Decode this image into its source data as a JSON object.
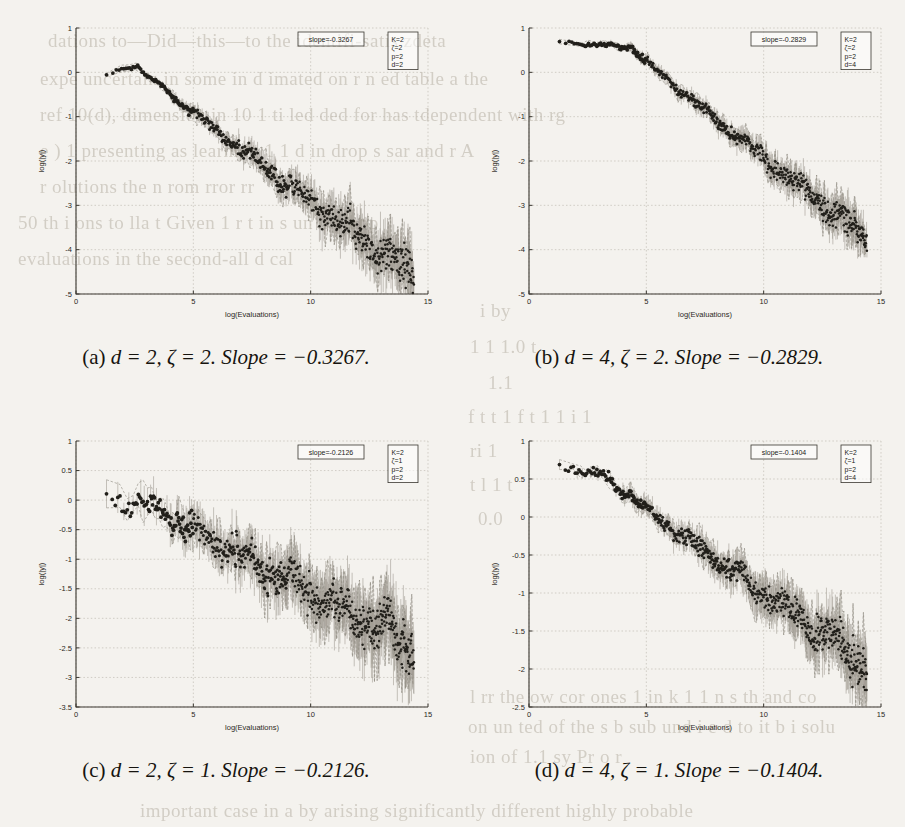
{
  "page": {
    "bleed_through_lines": [
      {
        "text": "dations to—Did—this—to the identifi-satis zdeta",
        "x": 48,
        "y": 30
      },
      {
        "text": "expe uncertain in some in d   imated on r n   ed table a the",
        "x": 40,
        "y": 68
      },
      {
        "text": "ref 10(d), dimension in 10 1 ti   led ded for has tdependent with rg",
        "x": 40,
        "y": 104
      },
      {
        "text": "e  )  1 presenting as learning     1     1  d   in drop   s   sar   and r    A",
        "x": 40,
        "y": 140
      },
      {
        "text": "r olutions the   n   rom   rror rr",
        "x": 40,
        "y": 176
      },
      {
        "text": "50 th   i   ons   to lla  t    Given   1    r    t     in   s    un   n   1    upp",
        "x": 18,
        "y": 212
      },
      {
        "text": "evaluations in the  second-all d  cal",
        "x": 18,
        "y": 248
      },
      {
        "text": "i                              by",
        "x": 480,
        "y": 300
      },
      {
        "text": "1   1                   1.0   t",
        "x": 470,
        "y": 336
      },
      {
        "text": "1.1",
        "x": 488,
        "y": 372
      },
      {
        "text": "f    t                   t   1    f    t   1   1   i    1",
        "x": 468,
        "y": 406
      },
      {
        "text": "ri                              1",
        "x": 470,
        "y": 440
      },
      {
        "text": "t    l    1                 t",
        "x": 470,
        "y": 474
      },
      {
        "text": "0.0",
        "x": 478,
        "y": 508
      },
      {
        "text": "l    rr     the   ow   cor   ones     1   in    k    1   1   n    s   th    and   co",
        "x": 470,
        "y": 686
      },
      {
        "text": "on   un   ted of the   s   b   sub   und   i   e     d    to   it   b   i   solu",
        "x": 468,
        "y": 716
      },
      {
        "text": "ion   of    1.1   sy    Pr    o    r",
        "x": 470,
        "y": 746
      },
      {
        "text": "important case in a by arising significantly different highly probable",
        "x": 140,
        "y": 800
      }
    ]
  },
  "figures": [
    {
      "id": "a",
      "caption_label": "(a)",
      "caption_body": "d = 2, ζ = 2.",
      "caption_slope": "Slope = −0.3267.",
      "slope_box": "slope=-0.3267",
      "legend": [
        "K=2",
        "ζ=2",
        "p=2",
        "d=2"
      ],
      "chart_data": {
        "type": "scatter",
        "title": "",
        "xlabel": "log(Evaluations)",
        "ylabel": "log(|y|)",
        "xlim": [
          0,
          15
        ],
        "ylim": [
          -5,
          1
        ],
        "xticks": [
          0,
          5,
          10,
          15
        ],
        "yticks": [
          1,
          0,
          -1,
          -2,
          -3,
          -4,
          -5
        ],
        "xtick_labels": [
          "0",
          "5",
          "10",
          "15"
        ],
        "ytick_labels": [
          "1",
          "0",
          "-1",
          "-2",
          "-3",
          "-4",
          "-5"
        ],
        "grid": true,
        "legend_position": "top-right",
        "fit_slope": -0.3267,
        "fit_intercept": 0.55,
        "series": [
          {
            "name": "log|y| vs log(Evaluations)",
            "x_start": 1.3,
            "x_end": 14.4,
            "y_start": -0.05,
            "y_end": -4.6,
            "plateau_end": 2.6,
            "plateau_y": 0.15,
            "noise_start": 0.04,
            "noise_end": 0.42,
            "n_points": 520
          }
        ]
      }
    },
    {
      "id": "b",
      "caption_label": "(b)",
      "caption_body": "d = 4, ζ = 2.",
      "caption_slope": "Slope = −0.2829.",
      "slope_box": "slope=-0.2829",
      "legend": [
        "K=2",
        "ζ=2",
        "p=2",
        "d=4"
      ],
      "chart_data": {
        "type": "scatter",
        "title": "",
        "xlabel": "log(Evaluations)",
        "ylabel": "log(|y|)",
        "xlim": [
          0,
          15
        ],
        "ylim": [
          -5,
          1
        ],
        "xticks": [
          0,
          5,
          10,
          15
        ],
        "yticks": [
          1,
          0,
          -1,
          -2,
          -3,
          -4,
          -5
        ],
        "xtick_labels": [
          "0",
          "5",
          "10",
          "15"
        ],
        "ytick_labels": [
          "1",
          "0",
          "-1",
          "-2",
          "-3",
          "-4",
          "-5"
        ],
        "grid": true,
        "legend_position": "top-right",
        "fit_slope": -0.2829,
        "fit_intercept": 1.05,
        "series": [
          {
            "name": "log|y| vs log(Evaluations)",
            "x_start": 1.3,
            "x_end": 14.4,
            "y_start": 0.68,
            "y_end": -3.75,
            "plateau_end": 4.4,
            "plateau_y": 0.55,
            "noise_start": 0.03,
            "noise_end": 0.3,
            "n_points": 540
          }
        ]
      }
    },
    {
      "id": "c",
      "caption_label": "(c)",
      "caption_body": "d = 2, ζ = 1.",
      "caption_slope": "Slope = −0.2126.",
      "slope_box": "slope=-0.2126",
      "legend": [
        "K=2",
        "ζ=1",
        "p=2",
        "d=2"
      ],
      "chart_data": {
        "type": "scatter",
        "title": "",
        "xlabel": "log(Evaluations)",
        "ylabel": "log(|y|)",
        "xlim": [
          0,
          15
        ],
        "ylim": [
          -3.5,
          1
        ],
        "xticks": [
          0,
          5,
          10,
          15
        ],
        "yticks": [
          1,
          0.5,
          0,
          -0.5,
          -1,
          -1.5,
          -2,
          -2.5,
          -3,
          -3.5
        ],
        "xtick_labels": [
          "0",
          "5",
          "10",
          "15"
        ],
        "ytick_labels": [
          "1",
          "0.5",
          "0",
          "-0.5",
          "-1",
          "-1.5",
          "-2",
          "-2.5",
          "-3",
          "-3.5"
        ],
        "grid": true,
        "legend_position": "top-right",
        "fit_slope": -0.2126,
        "fit_intercept": 0.35,
        "series": [
          {
            "name": "log|y| vs log(Evaluations)",
            "x_start": 1.3,
            "x_end": 14.4,
            "y_start": 0.0,
            "y_end": -2.45,
            "plateau_end": 3.0,
            "plateau_y": -0.05,
            "noise_start": 0.18,
            "noise_end": 0.4,
            "n_points": 620
          }
        ]
      }
    },
    {
      "id": "d",
      "caption_label": "(d)",
      "caption_body": "d = 4, ζ = 1.",
      "caption_slope": "Slope = −0.1404.",
      "slope_box": "slope=-0.1404",
      "legend": [
        "K=2",
        "ζ=1",
        "p=2",
        "d=4"
      ],
      "chart_data": {
        "type": "scatter",
        "title": "",
        "xlabel": "log(Evaluations)",
        "ylabel": "log(|y|)",
        "xlim": [
          0,
          15
        ],
        "ylim": [
          -2.5,
          1
        ],
        "xticks": [
          0,
          5,
          10,
          15
        ],
        "yticks": [
          1,
          0.5,
          0,
          -0.5,
          -1,
          -1.5,
          -2,
          -2.5
        ],
        "xtick_labels": [
          "0",
          "5",
          "10",
          "15"
        ],
        "ytick_labels": [
          "1",
          "0.5",
          "0",
          "-0.5",
          "-1",
          "-1.5",
          "-2",
          "-2.5"
        ],
        "grid": true,
        "legend_position": "top-right",
        "fit_slope": -0.1404,
        "fit_intercept": 0.85,
        "series": [
          {
            "name": "log|y| vs log(Evaluations)",
            "x_start": 1.3,
            "x_end": 14.4,
            "y_start": 0.66,
            "y_end": -1.95,
            "plateau_end": 3.2,
            "plateau_y": 0.55,
            "noise_start": 0.05,
            "noise_end": 0.26,
            "n_points": 600
          }
        ]
      }
    }
  ]
}
